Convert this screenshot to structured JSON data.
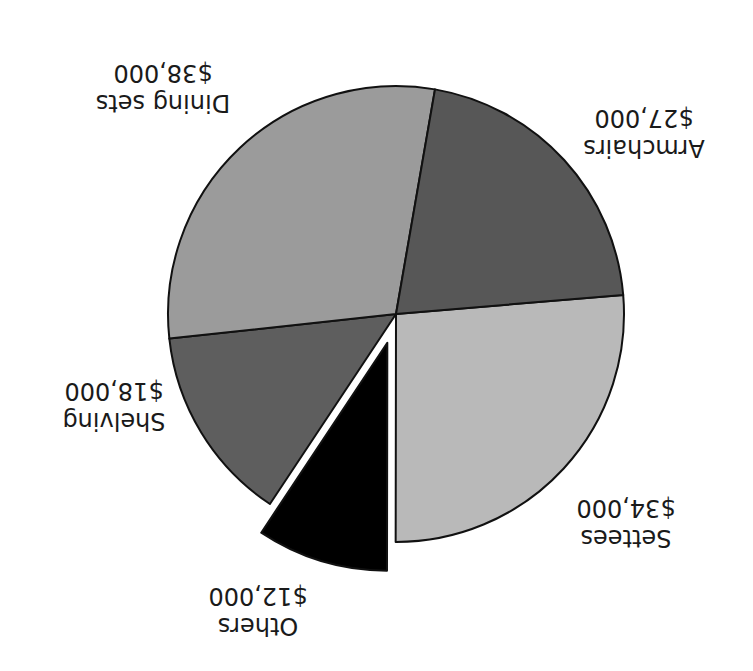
{
  "chart_data": {
    "type": "pie",
    "title": "",
    "orientation_note": "image displayed rotated 180 degrees",
    "categories": [
      "Settees",
      "Others",
      "Shelving",
      "Dining sets",
      "Armchairs"
    ],
    "values": [
      34000,
      12000,
      18000,
      38000,
      27000
    ],
    "value_labels": [
      "$34,000",
      "$12,000",
      "$18,000",
      "$38,000",
      "$27,000"
    ],
    "colors": [
      "#b9b9b9",
      "#000000",
      "#5e5e5e",
      "#9b9b9b",
      "#575757"
    ],
    "exploded": [
      "Others"
    ],
    "total": 129000,
    "legend": "none (labels placed outside slices)"
  },
  "labels": {
    "settees": {
      "name": "Settees",
      "value": "$34,000"
    },
    "others": {
      "name": "Others",
      "value": "$12,000"
    },
    "shelving": {
      "name": "Shelving",
      "value": "$18,000"
    },
    "dining": {
      "name": "Dining sets",
      "value": "$38,000"
    },
    "armchairs": {
      "name": "Armchairs",
      "value": "$27,000"
    }
  }
}
